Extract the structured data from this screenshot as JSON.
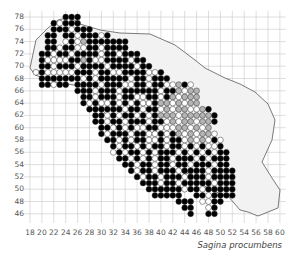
{
  "map": {
    "title": "Sagina procumbens",
    "x_axis": {
      "ticks": [
        "18",
        "20",
        "22",
        "24",
        "26",
        "28",
        "30",
        "32",
        "34",
        "36",
        "38",
        "40",
        "42",
        "44",
        "46",
        "48",
        "50",
        "52",
        "54",
        "56",
        "58",
        "60"
      ],
      "min": 18,
      "max": 60
    },
    "y_axis": {
      "ticks": [
        "78",
        "76",
        "74",
        "72",
        "70",
        "68",
        "66",
        "64",
        "62",
        "60",
        "58",
        "56",
        "54",
        "52",
        "50",
        "48",
        "46"
      ],
      "min": 46,
      "max": 78
    },
    "colors": {
      "grid": "#c8c8c8",
      "black_dot": "#000000",
      "white_dot": "#ffffff",
      "gray_dot": "#b4b4b4",
      "outline": "#444444",
      "dot_stroke": "#333333"
    },
    "legend_note": "Filled black = recent records, open = older records, gray = uncertain",
    "dot_rows_x_start": 18,
    "dot_rows_y_start": 78,
    "dot_rows": [
      "......BBB..................................",
      "....BWBBB..................................",
      "....BBBWBBB................................",
      "...BB.BBWBBBWB.............................",
      "...BB.WBWGBBBBBBB..........................",
      "...BBWBBWWBBWBBBB..........................",
      "..BBWBBWBBBBWBBWBBB........................",
      "..BWWWWBBGBWWBBBBWBB.......................",
      "..BBWBBBWBBBBWBBBBWBB......................",
      ".WBWWWWWBBBWBBWWBBBBWWB....................",
      "..BBBBBBBWBWBBBBBWBBWBBB...................",
      "..BBWBB.BBBBWBBBWWBBWBBWWGBW...............",
      "........BBBWBBBWBBBBBBWBBGWGG..............",
      ".........BBWBBBWBBWWBBWBGWGGG..............",
      ".........BWBWWBWBWBWWBGGWGWGG..............",
      "..........BBBBBBWBBWBBWGWGGWWGB............",
      "...........BBWBWBBWBWBGGGWGGGGGB...........",
      "...........BBWBBWBBBWBBWGWGGWGGB...........",
      "............BBWBWBWWBBWWWGGWGWG............",
      "............BWBBBWBBWWBWBGWGWGGW...........",
      ".............BBWBWBBWWBWBBWGWGWBW..........",
      "..............BWBBWBWBBWBBWBWBWWB..........",
      "..............WBWBBWBWBBBWBWBWBWBB.........",
      "...............BBWBWBWBBWBBBWBWBBB.........",
      "................BBWBBWBBWBBWBBBWBB.........",
      ".................BWBBWBBBWBBBBWBBBB........",
      "..................BWBBWBBBWBBBWBBBB........",
      "...................BBBWBBWBBBBBWBBB........",
      "....................BBBBBBWBBWBBBBB........",
      ".....................BBBBB..BBWBBBB........",
      ".........................BBB.WWBB..........",
      "..........................BB..WB...........",
      "...........................B..BB...........",
      "...........................................",
      "..........................................."
    ]
  }
}
